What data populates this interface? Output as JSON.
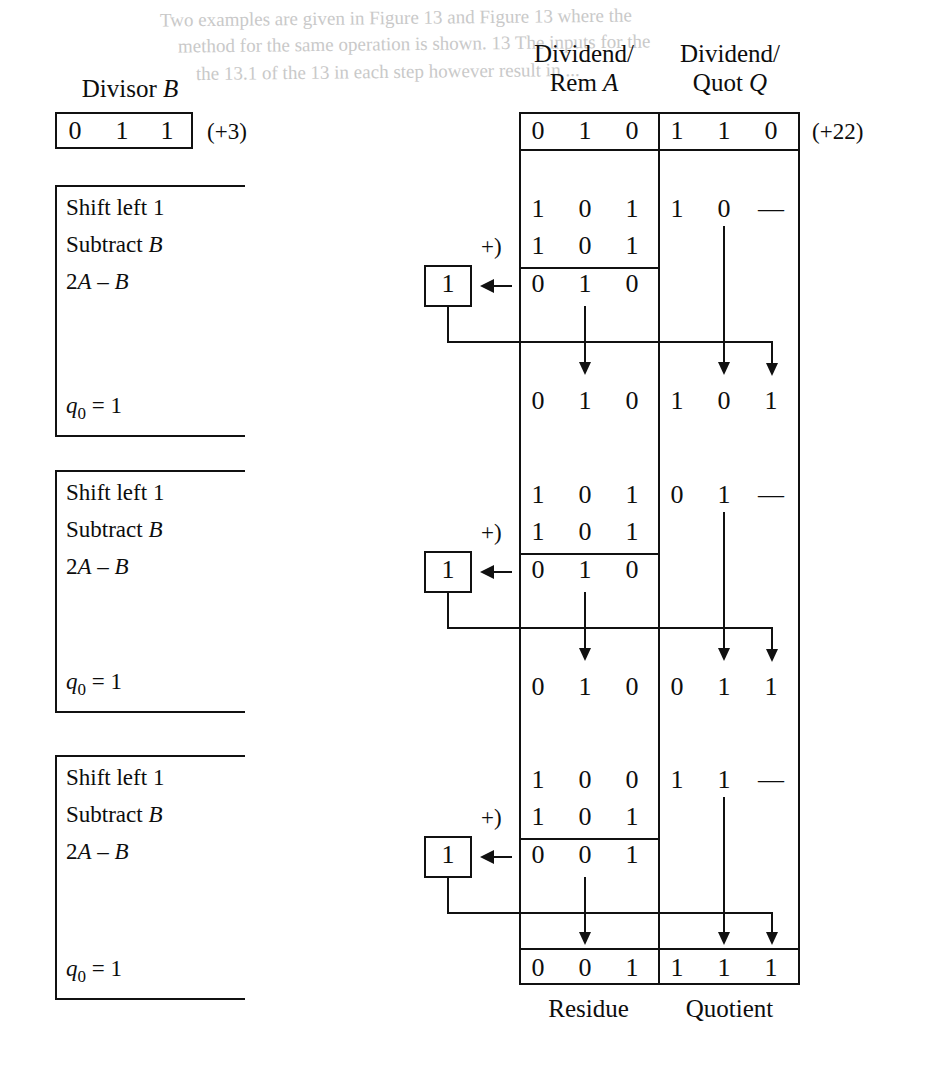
{
  "figure": {
    "bleed_lines": [
      "Two examples are given in Figure 13 and Figure 13 where the",
      "method for the same operation is shown. 13 The inputs for the",
      "the 13.1 of the 13 in each step however result in ..."
    ]
  },
  "divisor": {
    "caption": "Divisor B",
    "caption_letter": "B",
    "caption_word": "Divisor",
    "bits": [
      "0",
      "1",
      "1"
    ],
    "decimal": "(+3)"
  },
  "table": {
    "header_a": {
      "line1": "Dividend/",
      "line2_word": "Rem",
      "line2_letter": "A"
    },
    "header_q": {
      "line1": "Dividend/",
      "line2_word": "Quot",
      "line2_letter": "Q"
    },
    "initial": {
      "a": [
        "0",
        "1",
        "0"
      ],
      "q": [
        "1",
        "1",
        "0"
      ],
      "decimal": "(+22)"
    },
    "footer_a": "Residue",
    "footer_q": "Quotient"
  },
  "steps": [
    {
      "index": 1,
      "ops": {
        "line1": "Shift left 1",
        "line2_word": "Subtract",
        "line2_letter": "B",
        "line3": "2A – B",
        "line3_parts": {
          "two": "2",
          "a": "A",
          "minus": "–",
          "b": "B"
        },
        "result_label": "q",
        "result_sub": "0",
        "result_eq": "= 1"
      },
      "shifted_a": [
        "1",
        "0",
        "1"
      ],
      "shifted_q": [
        "1",
        "0",
        "—"
      ],
      "addend": [
        "1",
        "0",
        "1"
      ],
      "add_marker": "+)",
      "sum_a": [
        "0",
        "1",
        "0"
      ],
      "carry_box": "1",
      "next_a": [
        "0",
        "1",
        "0"
      ],
      "next_q": [
        "1",
        "0",
        "1"
      ]
    },
    {
      "index": 2,
      "ops": {
        "line1": "Shift left 1",
        "line2_word": "Subtract",
        "line2_letter": "B",
        "line3": "2A – B",
        "line3_parts": {
          "two": "2",
          "a": "A",
          "minus": "–",
          "b": "B"
        },
        "result_label": "q",
        "result_sub": "0",
        "result_eq": "= 1"
      },
      "shifted_a": [
        "1",
        "0",
        "1"
      ],
      "shifted_q": [
        "0",
        "1",
        "—"
      ],
      "addend": [
        "1",
        "0",
        "1"
      ],
      "add_marker": "+)",
      "sum_a": [
        "0",
        "1",
        "0"
      ],
      "carry_box": "1",
      "next_a": [
        "0",
        "1",
        "0"
      ],
      "next_q": [
        "0",
        "1",
        "1"
      ]
    },
    {
      "index": 3,
      "ops": {
        "line1": "Shift left 1",
        "line2_word": "Subtract",
        "line2_letter": "B",
        "line3": "2A – B",
        "line3_parts": {
          "two": "2",
          "a": "A",
          "minus": "–",
          "b": "B"
        },
        "result_label": "q",
        "result_sub": "0",
        "result_eq": "= 1"
      },
      "shifted_a": [
        "1",
        "0",
        "0"
      ],
      "shifted_q": [
        "1",
        "1",
        "—"
      ],
      "addend": [
        "1",
        "0",
        "1"
      ],
      "add_marker": "+)",
      "sum_a": [
        "0",
        "0",
        "1"
      ],
      "carry_box": "1",
      "next_a": [
        "0",
        "0",
        "1"
      ],
      "next_q": [
        "1",
        "1",
        "1"
      ]
    }
  ],
  "colors": {
    "ink": "#111111",
    "paper": "#ffffff",
    "bleed": "#c9c9c9"
  }
}
